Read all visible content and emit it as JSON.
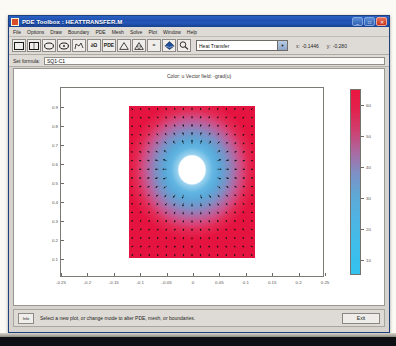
{
  "window": {
    "title": "PDE Toolbox : HEATTRANSFER.M",
    "icon": "pde-app-icon",
    "minimize_label": "_",
    "maximize_label": "□",
    "close_label": "✕"
  },
  "menubar": {
    "items": [
      {
        "label": "File"
      },
      {
        "label": "Options"
      },
      {
        "label": "Draw"
      },
      {
        "label": "Boundary"
      },
      {
        "label": "PDE"
      },
      {
        "label": "Mesh"
      },
      {
        "label": "Solve"
      },
      {
        "label": "Plot"
      },
      {
        "label": "Window"
      },
      {
        "label": "Help"
      }
    ]
  },
  "toolbar": {
    "buttons": [
      {
        "name": "draw-rectangle",
        "glyph": "rect"
      },
      {
        "name": "draw-rectangle-centered",
        "glyph": "rect-center"
      },
      {
        "name": "draw-ellipse",
        "glyph": "ellipse"
      },
      {
        "name": "draw-ellipse-centered",
        "glyph": "ellipse-center"
      },
      {
        "name": "draw-polygon",
        "glyph": "polygon"
      },
      {
        "name": "boundary-mode",
        "glyph": "∂Ω"
      },
      {
        "name": "pde-mode",
        "glyph": "PDE"
      },
      {
        "name": "mesh-mode",
        "glyph": "triangle"
      },
      {
        "name": "refine-mesh",
        "glyph": "triangle-refine"
      },
      {
        "name": "solve-pde",
        "glyph": "="
      },
      {
        "name": "plot-solution",
        "glyph": "surf"
      },
      {
        "name": "zoom-tool",
        "glyph": "magnifier"
      }
    ],
    "application_select": {
      "value": "Heat Transfer",
      "arrow": "▼"
    },
    "coordinates": {
      "x_label": "x:",
      "x_value": "-0.1446",
      "y_label": "y:",
      "y_value": "-0.280"
    }
  },
  "formula": {
    "label": "Set formula:",
    "value": "SQ1-C1",
    "placeholder": ""
  },
  "figure": {
    "title": "Color: u  Vector field: -grad(u)"
  },
  "chart_data": {
    "type": "heatmap",
    "title": "Color: u  Vector field: -grad(u)",
    "xlabel": "",
    "ylabel": "",
    "xlim": [
      -0.25,
      0.25
    ],
    "ylim": [
      0.0,
      1.0
    ],
    "xticks": [
      "-0.25",
      "-0.2",
      "-0.15",
      "-0.1",
      "-0.05",
      "0",
      "0.05",
      "0.1",
      "0.15",
      "0.2",
      "0.25"
    ],
    "xtick_values": [
      -0.25,
      -0.2,
      -0.15,
      -0.1,
      -0.05,
      0,
      0.05,
      0.1,
      0.15,
      0.2,
      0.25
    ],
    "yticks": [
      "0.1",
      "0.2",
      "0.3",
      "0.4",
      "0.5",
      "0.6",
      "0.7",
      "0.8",
      "0.9"
    ],
    "ytick_values": [
      0.1,
      0.2,
      0.3,
      0.4,
      0.5,
      0.6,
      0.7,
      0.8,
      0.9
    ],
    "grid": false,
    "legend": "colorbar-right",
    "colorbar": {
      "orientation": "vertical",
      "ticks": [
        "60",
        "50",
        "40",
        "30",
        "20",
        "10"
      ],
      "tick_values": [
        60,
        50,
        40,
        30,
        20,
        10
      ],
      "range": [
        5,
        65
      ],
      "colormap": "cool-to-hot (blue → red)",
      "low_color": "#33c2ef",
      "high_color": "#ea1741"
    },
    "domain": {
      "shape": "rectangle minus circle",
      "rect_x": [
        -0.12,
        0.12
      ],
      "rect_y": [
        0.2,
        0.8
      ],
      "hole_center": [
        0.0,
        0.54
      ],
      "hole_radius": 0.058
    },
    "field_description": "Temperature u highest at outer rectangle edges (red, ~60) and lowest at the circular hole boundary (blue, ~10); arrows show -grad(u) pointing radially outward from the hole.",
    "series": [
      {
        "name": "u (color)",
        "min": 5,
        "max": 65
      },
      {
        "name": "-grad(u) (arrows)",
        "direction": "radial outward from hole"
      }
    ]
  },
  "statusbar": {
    "info_label": "Info",
    "message": "Select a new plot, or change mode to alter PDE, mesh, or boundaries.",
    "exit_label": "Exit"
  }
}
